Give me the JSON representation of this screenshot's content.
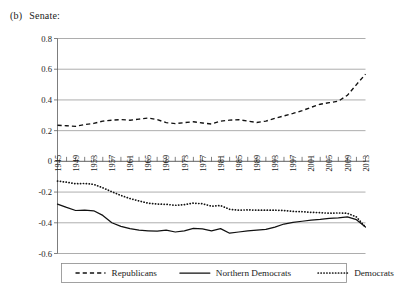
{
  "caption": {
    "label": "(b)",
    "text": "Senate:"
  },
  "chart_data": {
    "type": "line",
    "xlabel": "",
    "ylabel": "",
    "xlim": [
      1945,
      2013
    ],
    "ylim": [
      -0.6,
      0.8
    ],
    "yticks": [
      0.8,
      0.6,
      0.4,
      0.2,
      0,
      -0.2,
      -0.4,
      -0.6
    ],
    "ytick_labels": [
      "0.8",
      "0.6",
      "0.4",
      "0.2",
      "0",
      "-0.2",
      "-0.4",
      "-0.6"
    ],
    "xticks": [
      1945,
      1949,
      1953,
      1957,
      1961,
      1965,
      1969,
      1973,
      1977,
      1981,
      1985,
      1989,
      1993,
      1997,
      2001,
      2005,
      2009,
      2013
    ],
    "xtick_labels": [
      "1945",
      "1949",
      "1953",
      "1957",
      "1961",
      "1965",
      "1969",
      "1973",
      "1977",
      "1981",
      "1985",
      "1989",
      "1993",
      "1997",
      "2001",
      "2005",
      "2009",
      "2013"
    ],
    "minor_xtick_interval": 2,
    "grid": "horizontal",
    "legend_position": "bottom",
    "x": [
      1945,
      1947,
      1949,
      1951,
      1953,
      1955,
      1957,
      1959,
      1961,
      1963,
      1965,
      1967,
      1969,
      1971,
      1973,
      1975,
      1977,
      1979,
      1981,
      1983,
      1985,
      1987,
      1989,
      1991,
      1993,
      1995,
      1997,
      1999,
      2001,
      2003,
      2005,
      2007,
      2009,
      2011,
      2013
    ],
    "series": [
      {
        "name": "Republicans",
        "style": "dashed",
        "values": [
          0.235,
          0.232,
          0.228,
          0.24,
          0.247,
          0.262,
          0.268,
          0.272,
          0.268,
          0.275,
          0.282,
          0.272,
          0.252,
          0.246,
          0.252,
          0.258,
          0.25,
          0.243,
          0.262,
          0.268,
          0.272,
          0.262,
          0.253,
          0.262,
          0.28,
          0.296,
          0.312,
          0.33,
          0.352,
          0.372,
          0.382,
          0.392,
          0.43,
          0.5,
          0.568
        ]
      },
      {
        "name": "Northern Democrats",
        "style": "solid",
        "values": [
          -0.278,
          -0.3,
          -0.32,
          -0.318,
          -0.322,
          -0.352,
          -0.4,
          -0.423,
          -0.438,
          -0.448,
          -0.452,
          -0.455,
          -0.448,
          -0.46,
          -0.452,
          -0.437,
          -0.44,
          -0.452,
          -0.438,
          -0.468,
          -0.46,
          -0.452,
          -0.448,
          -0.443,
          -0.428,
          -0.408,
          -0.398,
          -0.39,
          -0.382,
          -0.378,
          -0.372,
          -0.368,
          -0.362,
          -0.38,
          -0.428
        ]
      },
      {
        "name": "Democrats",
        "style": "dotted",
        "values": [
          -0.128,
          -0.136,
          -0.146,
          -0.144,
          -0.15,
          -0.172,
          -0.198,
          -0.222,
          -0.242,
          -0.258,
          -0.272,
          -0.278,
          -0.28,
          -0.286,
          -0.282,
          -0.272,
          -0.276,
          -0.292,
          -0.288,
          -0.312,
          -0.318,
          -0.316,
          -0.318,
          -0.318,
          -0.318,
          -0.32,
          -0.326,
          -0.328,
          -0.332,
          -0.334,
          -0.338,
          -0.336,
          -0.338,
          -0.362,
          -0.428
        ]
      }
    ]
  },
  "legend": {
    "items": [
      {
        "label": "Republicans",
        "marker": "dashed-line-swatch"
      },
      {
        "label": "Northern Democrats",
        "marker": "solid-line-swatch"
      },
      {
        "label": "Democrats",
        "marker": "dotted-line-swatch"
      }
    ]
  }
}
